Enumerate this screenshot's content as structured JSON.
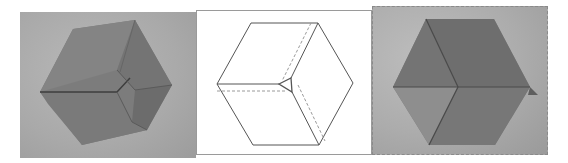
{
  "figure": {
    "panels": [
      {
        "id": "left-photo",
        "kind": "photo",
        "subject": "folded origami hexagon (paper model)"
      },
      {
        "id": "center-diagram",
        "kind": "line-diagram",
        "subject": "hexagon fold diagram with dashed hidden creases"
      },
      {
        "id": "right-photo",
        "kind": "photo",
        "subject": "folded origami hexagon forming cube illusion"
      }
    ]
  },
  "colors": {
    "photo_background": "#aaaaaa",
    "paper_dark": "#6f6f6f",
    "paper_mid": "#7e7e7e",
    "paper_light": "#8c8c8c",
    "diagram_line": "#555555",
    "diagram_dashed": "#9a9a9a"
  }
}
